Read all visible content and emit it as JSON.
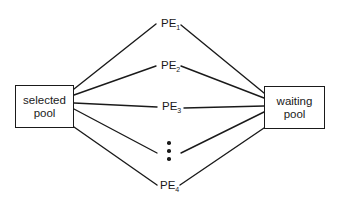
{
  "diagram": {
    "nodes": {
      "selected_pool": {
        "line1": "selected",
        "line2": "pool"
      },
      "waiting_pool": {
        "line1": "waiting",
        "line2": "pool"
      }
    },
    "processing_elements": [
      {
        "prefix": "PE",
        "subscript": "1"
      },
      {
        "prefix": "PE",
        "subscript": "2"
      },
      {
        "prefix": "PE",
        "subscript": "3"
      },
      {
        "prefix": "PE",
        "subscript": "4"
      }
    ],
    "ellipsis": "vertical-dots",
    "edges": [
      {
        "from": "selected pool",
        "to": "PE1"
      },
      {
        "from": "PE1",
        "to": "waiting pool"
      },
      {
        "from": "selected pool",
        "to": "PE2"
      },
      {
        "from": "PE2",
        "to": "waiting pool"
      },
      {
        "from": "selected pool",
        "to": "PE3"
      },
      {
        "from": "PE3",
        "to": "waiting pool"
      },
      {
        "from": "selected pool",
        "to": "..."
      },
      {
        "from": "...",
        "to": "waiting pool"
      },
      {
        "from": "selected pool",
        "to": "PE4"
      },
      {
        "from": "PE4",
        "to": "waiting pool"
      }
    ],
    "colors": {
      "stroke": "#1a1a1a",
      "background": "#ffffff"
    }
  }
}
